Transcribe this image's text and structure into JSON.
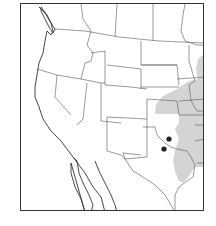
{
  "map": {
    "title": "",
    "region": "Western and Central United States",
    "colors": {
      "range_fill": "#cfcfcf",
      "locality_dot": "#222222",
      "border": "#555555",
      "frame": "#333333"
    },
    "layers": [
      {
        "name": "state-boundaries",
        "type": "outline"
      },
      {
        "name": "distribution-range",
        "type": "shaded-area",
        "location": "eastern edge (eastern Kansas, Oklahoma, Texas, Missouri, Iowa region)"
      },
      {
        "name": "locality-points",
        "type": "dots",
        "count": 2
      }
    ],
    "localities": [
      {
        "label": "locality-1",
        "x": 168,
        "y": 138
      },
      {
        "label": "locality-2",
        "x": 163,
        "y": 148
      }
    ]
  }
}
